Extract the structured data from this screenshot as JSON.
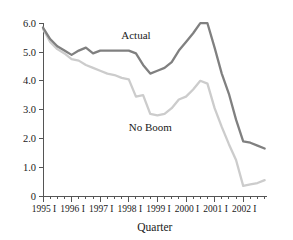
{
  "chart_data": {
    "type": "line",
    "title": "",
    "xlabel": "Quarter",
    "ylabel": "",
    "ylim": [
      0,
      6.0
    ],
    "grid": false,
    "legend_position": "inline-annotation",
    "y_ticks": [
      "0",
      "1.0",
      "2.0",
      "3.0",
      "4.0",
      "5.0",
      "6.0"
    ],
    "y_tick_values": [
      0,
      1.0,
      2.0,
      3.0,
      4.0,
      5.0,
      6.0
    ],
    "x_tick_labels": [
      "1995 I",
      "1996 I",
      "1997 I",
      "1998 I",
      "1999 I",
      "2000 I",
      "2001 I",
      "2002 I"
    ],
    "x_major_tick_quarters": [
      0,
      4,
      8,
      12,
      16,
      20,
      24,
      28
    ],
    "x_minor_tick_count": 32,
    "x": [
      "1995 I",
      "1995 II",
      "1995 III",
      "1995 IV",
      "1996 I",
      "1996 II",
      "1996 III",
      "1996 IV",
      "1997 I",
      "1997 II",
      "1997 III",
      "1997 IV",
      "1998 I",
      "1998 II",
      "1998 III",
      "1998 IV",
      "1999 I",
      "1999 II",
      "1999 III",
      "1999 IV",
      "2000 I",
      "2000 II",
      "2000 III",
      "2000 IV",
      "2001 I",
      "2001 II",
      "2001 III",
      "2001 IV",
      "2002 I",
      "2002 II",
      "2002 III",
      "2002 IV"
    ],
    "series": [
      {
        "name": "Actual",
        "color": "#808080",
        "label_x_index": 13,
        "label_value": 5.45,
        "values": [
          5.85,
          5.45,
          5.2,
          5.05,
          4.9,
          5.05,
          5.15,
          4.95,
          5.05,
          5.05,
          5.05,
          5.05,
          5.05,
          4.95,
          4.55,
          4.25,
          4.35,
          4.45,
          4.65,
          5.05,
          5.35,
          5.65,
          6.0,
          6.0,
          5.15,
          4.25,
          3.55,
          2.65,
          1.9,
          1.85,
          1.75,
          1.65
        ]
      },
      {
        "name": "No Boom",
        "color": "#cccccc",
        "label_x_index": 15,
        "label_value": 2.25,
        "values": [
          5.8,
          5.35,
          5.1,
          4.95,
          4.75,
          4.7,
          4.55,
          4.45,
          4.35,
          4.25,
          4.2,
          4.1,
          4.05,
          3.45,
          3.5,
          2.85,
          2.8,
          2.85,
          3.05,
          3.35,
          3.45,
          3.7,
          4.0,
          3.9,
          3.05,
          2.4,
          1.8,
          1.25,
          0.35,
          0.4,
          0.45,
          0.55
        ]
      }
    ]
  },
  "axis": {
    "x_title": "Quarter"
  }
}
